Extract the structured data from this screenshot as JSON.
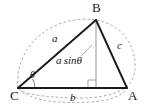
{
  "figure": {
    "kind": "geometry-diagram",
    "background_color": "#ffffff",
    "stroke_color": "#1a1a1a",
    "dashed_color": "#9a9a9a",
    "altitude_color": "#b3b3b3",
    "vertices": [
      {
        "id": "B",
        "label": "B",
        "x": 96,
        "y": 20
      },
      {
        "id": "C",
        "label": "C",
        "x": 18,
        "y": 88
      },
      {
        "id": "A",
        "label": "A",
        "x": 127,
        "y": 88
      }
    ],
    "vertex_labels": [
      {
        "name": "vertex-label-b",
        "text": "B",
        "x": 92,
        "y": 2
      },
      {
        "name": "vertex-label-c",
        "text": "C",
        "x": 11,
        "y": 89
      },
      {
        "name": "vertex-label-a",
        "text": "A",
        "x": 128,
        "y": 89
      }
    ],
    "side_labels": [
      {
        "name": "side-label-a",
        "text": "a",
        "x": 52,
        "y": 37
      },
      {
        "name": "side-label-b",
        "text": "b",
        "x": 70,
        "y": 92
      },
      {
        "name": "side-label-c",
        "text": "c",
        "x": 117,
        "y": 42
      }
    ],
    "angle_label": {
      "name": "angle-label-theta",
      "text": "θ",
      "x": 31,
      "y": 70
    },
    "altitude_label": {
      "name": "altitude-label",
      "text": "a sinθ",
      "x": 57,
      "y": 55
    },
    "altitude": {
      "from_x": 96,
      "from_y": 20,
      "to_x": 96,
      "to_y": 88
    },
    "right_angle_marker": {
      "x": 88,
      "y": 80,
      "size": 8
    },
    "angle_arc": {
      "center_x": 18,
      "center_y": 88,
      "radius": 17
    },
    "ellipse": {
      "cx": 72,
      "cy": 60,
      "rx": 58,
      "ry": 42,
      "rotation": 0
    },
    "leader_line": {
      "x1": 80,
      "y1": 55,
      "x2": 90,
      "y2": 46
    }
  }
}
